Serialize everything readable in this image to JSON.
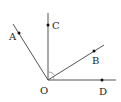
{
  "diagram": {
    "type": "geometry-rays",
    "origin": {
      "label": "O",
      "x": 48,
      "y": 80
    },
    "rays": [
      {
        "name": "OA",
        "end": [
          13,
          24
        ],
        "point": {
          "label": "A",
          "x": 19,
          "y": 33,
          "label_x": 10,
          "label_y": 40
        }
      },
      {
        "name": "OC",
        "end": [
          48,
          13
        ],
        "point": {
          "label": "C",
          "x": 48,
          "y": 25,
          "label_x": 52,
          "label_y": 29
        }
      },
      {
        "name": "OB",
        "end": [
          104,
          45
        ],
        "point": {
          "label": "B",
          "x": 94,
          "y": 51,
          "label_x": 93,
          "label_y": 64
        }
      },
      {
        "name": "OD",
        "end": [
          116,
          80
        ],
        "point": {
          "label": "D",
          "x": 102,
          "y": 80,
          "label_x": 99,
          "label_y": 94
        }
      }
    ],
    "labels": {
      "A": "A",
      "B": "B",
      "C": "C",
      "D": "D",
      "O": "O"
    },
    "line_color": "#555555",
    "point_color": "#111111"
  }
}
